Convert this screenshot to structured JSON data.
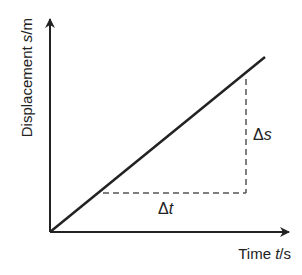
{
  "diagram": {
    "y_axis": {
      "label_text": "Displacement ",
      "label_var": "s",
      "label_unit": "/m"
    },
    "x_axis": {
      "label_text": "Time ",
      "label_var": "t",
      "label_unit": "/s"
    },
    "annotations": {
      "delta_s": {
        "symbol": "Δ",
        "var": "s"
      },
      "delta_t": {
        "symbol": "Δ",
        "var": "t"
      }
    },
    "colors": {
      "line": "#222222",
      "dash": "#555555",
      "text": "#222222"
    }
  }
}
